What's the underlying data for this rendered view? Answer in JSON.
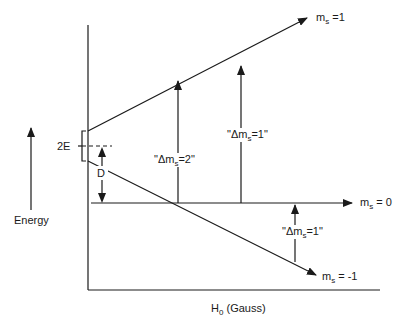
{
  "diagram": {
    "type": "energy-level-diagram",
    "axes": {
      "x_label_main": "H",
      "x_label_sub": "0",
      "x_label_rest": " (Gauss)",
      "energy_label": "Energy"
    },
    "levels": [
      {
        "name": "m_s = 1",
        "main": "m",
        "sub": "s",
        "rest": " =1"
      },
      {
        "name": "m_s = 0",
        "main": "m",
        "sub": "s",
        "rest": " = 0"
      },
      {
        "name": "m_s = -1",
        "main": "m",
        "sub": "s",
        "rest": " = -1"
      }
    ],
    "annotations": {
      "two_e": "2E",
      "d": "D"
    },
    "transitions": [
      {
        "name": "delta-ms-2",
        "prefix": "\"Δm",
        "sub": "s",
        "suffix": "=2\""
      },
      {
        "name": "delta-ms-1-upper",
        "prefix": "\"Δm",
        "sub": "s",
        "suffix": "=1\""
      },
      {
        "name": "delta-ms-1-lower",
        "prefix": "\"Δm",
        "sub": "s",
        "suffix": "=1\""
      }
    ]
  }
}
